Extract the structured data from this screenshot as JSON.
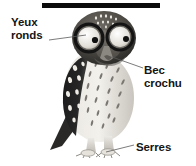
{
  "figure": {
    "kind": "labelled-illustration",
    "background_color": "#ffffff",
    "ink_color": "#151515",
    "top_rule": {
      "color": "#0b0b0b"
    }
  },
  "labels": {
    "eyes": "Yeux\nronds",
    "beak": "Bec\ncrochu",
    "talons": "Serres"
  },
  "leaders": [
    {
      "name": "leader-eyes",
      "from": [
        49,
        40
      ],
      "to": [
        86,
        35
      ]
    },
    {
      "name": "leader-beak",
      "from": [
        143,
        68
      ],
      "to": [
        112,
        57
      ]
    },
    {
      "name": "leader-talons",
      "from": [
        134,
        145
      ],
      "to": [
        106,
        152
      ]
    }
  ]
}
